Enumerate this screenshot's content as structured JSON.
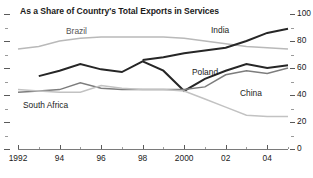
{
  "chart_data": {
    "type": "line",
    "title": "As a Share of Country's Total Exports in Services",
    "xlabel": "",
    "ylabel": "",
    "xlim": [
      1992,
      2005
    ],
    "ylim": [
      0,
      100
    ],
    "grid": false,
    "legend_position": "inline-labels",
    "y_ticks": [
      0,
      20,
      40,
      60,
      80,
      100
    ],
    "y_tick_labels": [
      "0",
      "20",
      "40",
      "60",
      "80",
      "100"
    ],
    "y_minor_ticks": [
      10,
      30,
      50,
      70,
      90
    ],
    "x_ticks": [
      1992,
      1994,
      1996,
      1998,
      2000,
      2002,
      2004
    ],
    "x_tick_labels": [
      "1992",
      "94",
      "96",
      "98",
      "2000",
      "02",
      "04"
    ],
    "x": [
      1992,
      1993,
      1994,
      1995,
      1996,
      1997,
      1998,
      1999,
      2000,
      2001,
      2002,
      2003,
      2004,
      2005
    ],
    "series": [
      {
        "name": "Brazil",
        "color": "#b9b9b9",
        "width": 1.5,
        "values": [
          74,
          76,
          80,
          82,
          83,
          83,
          83,
          83,
          82,
          80,
          78,
          76,
          75,
          74
        ]
      },
      {
        "name": "India",
        "color": "#262626",
        "width": 2.0,
        "values": [
          null,
          null,
          null,
          null,
          null,
          null,
          66,
          68,
          71,
          73,
          75,
          80,
          86,
          89
        ]
      },
      {
        "name": "Poland",
        "color": "#262626",
        "width": 2.0,
        "values": [
          null,
          54,
          58,
          63,
          59,
          57,
          65,
          58,
          43,
          52,
          58,
          63,
          60,
          62
        ],
        "note": "dark upper-middle zigzag series"
      },
      {
        "name": "China",
        "color": "#7d7d7d",
        "width": 1.5,
        "values": [
          42,
          43,
          44,
          49,
          45,
          44,
          44,
          44,
          44,
          46,
          55,
          58,
          56,
          60
        ]
      },
      {
        "name": "South Africa",
        "color": "#c2c2c2",
        "width": 1.5,
        "values": [
          44,
          43,
          42,
          42,
          47,
          45,
          44,
          44,
          43,
          37,
          31,
          25,
          24,
          24
        ]
      }
    ],
    "annotations": [
      {
        "text": "Brazil",
        "x_px": 66,
        "y_px": 27,
        "color": "#555555"
      },
      {
        "text": "India",
        "x_px": 211,
        "y_px": 26,
        "color": "#1b1b1b"
      },
      {
        "text": "Poland",
        "x_px": 192,
        "y_px": 68,
        "color": "#1b1b1b"
      },
      {
        "text": "China",
        "x_px": 240,
        "y_px": 89,
        "color": "#1b1b1b"
      },
      {
        "text": "South Africa",
        "x_px": 23,
        "y_px": 101,
        "color": "#1b1b1b"
      }
    ]
  }
}
